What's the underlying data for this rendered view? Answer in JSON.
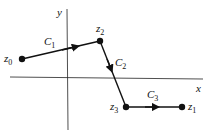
{
  "axes": {
    "x_label": "x",
    "y_label": "y"
  },
  "points": [
    {
      "id": "z0",
      "name": "z",
      "sub": "0",
      "x": 22,
      "y": 59
    },
    {
      "id": "z2",
      "name": "z",
      "sub": "2",
      "x": 100,
      "y": 41
    },
    {
      "id": "z3",
      "name": "z",
      "sub": "3",
      "x": 126,
      "y": 107
    },
    {
      "id": "z1",
      "name": "z",
      "sub": "1",
      "x": 182,
      "y": 107
    }
  ],
  "segments": [
    {
      "id": "C1",
      "name": "C",
      "sub": "1",
      "from": "z0",
      "to": "z2"
    },
    {
      "id": "C2",
      "name": "C",
      "sub": "2",
      "from": "z2",
      "to": "z3"
    },
    {
      "id": "C3",
      "name": "C",
      "sub": "3",
      "from": "z3",
      "to": "z1"
    }
  ],
  "colors": {
    "stroke": "#111111",
    "axis": "#222222"
  }
}
